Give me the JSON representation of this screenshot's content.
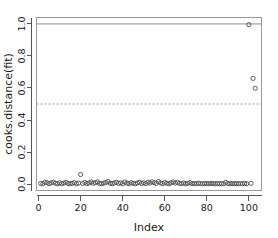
{
  "chart_data": {
    "type": "scatter",
    "title": "",
    "xlabel": "Index",
    "ylabel": "cooks.distance(fit)",
    "xlim": [
      -1,
      106
    ],
    "ylim": [
      -0.04,
      1.04
    ],
    "xticks": [
      0,
      20,
      40,
      60,
      80,
      100
    ],
    "xtick_labels": [
      "0",
      "20",
      "40",
      "60",
      "80",
      "100"
    ],
    "yticks": [
      0.0,
      0.2,
      0.4,
      0.6,
      0.8,
      1.0
    ],
    "ytick_labels": [
      "0.0",
      "0.2",
      "0.4",
      "0.6",
      "0.8",
      "1.0"
    ],
    "grid": false,
    "legend": null,
    "marker": "open-circle",
    "point_color": "#4d4d4d",
    "reference_lines": [
      {
        "name": "cutoff-1",
        "y": 1.0,
        "style": "solid",
        "color": "#8c8c8c"
      },
      {
        "name": "cutoff-0.5",
        "y": 0.5,
        "style": "dashed",
        "color": "#9a9a9a"
      }
    ],
    "x": [
      1,
      2,
      3,
      4,
      5,
      6,
      7,
      8,
      9,
      10,
      11,
      12,
      13,
      14,
      15,
      16,
      17,
      18,
      19,
      20,
      21,
      22,
      23,
      24,
      25,
      26,
      27,
      28,
      29,
      30,
      31,
      32,
      33,
      34,
      35,
      36,
      37,
      38,
      39,
      40,
      41,
      42,
      43,
      44,
      45,
      46,
      47,
      48,
      49,
      50,
      51,
      52,
      53,
      54,
      55,
      56,
      57,
      58,
      59,
      60,
      61,
      62,
      63,
      64,
      65,
      66,
      67,
      68,
      69,
      70,
      71,
      72,
      73,
      74,
      75,
      76,
      77,
      78,
      79,
      80,
      81,
      82,
      83,
      84,
      85,
      86,
      87,
      88,
      89,
      90,
      91,
      92,
      93,
      94,
      95,
      96,
      97,
      98,
      99,
      100,
      101,
      102,
      103
    ],
    "y": [
      0.004,
      0.002,
      0.012,
      0.009,
      0.003,
      0.007,
      0.012,
      0.005,
      0.002,
      0.008,
      0.003,
      0.006,
      0.011,
      0.004,
      0.002,
      0.005,
      0.009,
      0.003,
      0.006,
      0.06,
      0.004,
      0.01,
      0.003,
      0.007,
      0.013,
      0.005,
      0.009,
      0.014,
      0.004,
      0.002,
      0.006,
      0.01,
      0.016,
      0.005,
      0.003,
      0.007,
      0.011,
      0.004,
      0.008,
      0.002,
      0.013,
      0.006,
      0.003,
      0.009,
      0.005,
      0.002,
      0.007,
      0.011,
      0.004,
      0.008,
      0.003,
      0.012,
      0.006,
      0.014,
      0.009,
      0.004,
      0.016,
      0.007,
      0.003,
      0.01,
      0.005,
      0.002,
      0.008,
      0.013,
      0.006,
      0.011,
      0.004,
      0.003,
      0.007,
      0.002,
      0.005,
      0.009,
      0.003,
      0.004,
      0.002,
      0.006,
      0.003,
      0.002,
      0.004,
      0.003,
      0.002,
      0.005,
      0.003,
      0.002,
      0.004,
      0.002,
      0.003,
      0.002,
      0.011,
      0.004,
      0.002,
      0.003,
      0.002,
      0.004,
      0.002,
      0.003,
      0.002,
      0.004,
      0.002,
      0.995,
      0.005,
      0.66,
      0.598
    ]
  }
}
